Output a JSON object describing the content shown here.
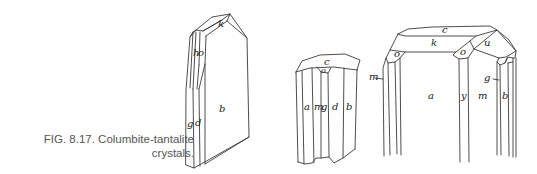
{
  "figure": {
    "caption_line1": "FIG. 8.17. Columbite-tantalite",
    "caption_line2": "crystals."
  },
  "crystals": [
    {
      "name": "crystal-1",
      "face_labels": [
        "k",
        "h",
        "o",
        "g",
        "d",
        "b"
      ]
    },
    {
      "name": "crystal-2",
      "face_labels": [
        "c",
        "o",
        "a",
        "m",
        "g",
        "d",
        "b"
      ]
    },
    {
      "name": "crystal-3",
      "face_labels": [
        "c",
        "k",
        "o",
        "o",
        "u",
        "m",
        "g",
        "a",
        "y",
        "m",
        "b"
      ]
    }
  ]
}
